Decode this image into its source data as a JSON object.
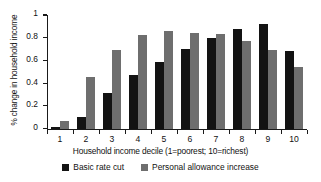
{
  "chart_data": {
    "type": "bar",
    "title": "",
    "subtitle": "",
    "xlabel": "Household income decile (1=poorest; 10=richest)",
    "ylabel": "% change in household income",
    "categories": [
      "1",
      "2",
      "3",
      "4",
      "5",
      "6",
      "7",
      "8",
      "9",
      "10"
    ],
    "series": [
      {
        "name": "Basic rate cut",
        "color": "#131313",
        "values": [
          0.01,
          0.1,
          0.31,
          0.47,
          0.59,
          0.7,
          0.8,
          0.875,
          0.92,
          0.685
        ]
      },
      {
        "name": "Personal allowance increase",
        "color": "#6e6e6e",
        "values": [
          0.065,
          0.455,
          0.695,
          0.825,
          0.855,
          0.845,
          0.835,
          0.77,
          0.695,
          0.545
        ]
      }
    ],
    "ylim": [
      0,
      1
    ],
    "yticks": [
      "0",
      "0.2",
      "0.4",
      "0.6",
      "0.8",
      "1"
    ],
    "ytick_values": [
      0,
      0.2,
      0.4,
      0.6,
      0.8,
      1
    ],
    "grid": false,
    "legend_position": "bottom"
  }
}
